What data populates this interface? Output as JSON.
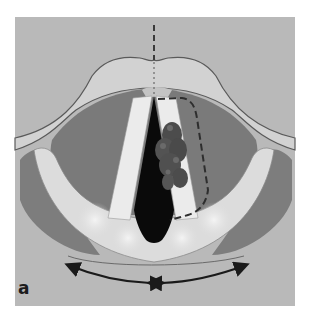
{
  "figure": {
    "panel_label": "a",
    "colors": {
      "background_panel": "#b9b9b9",
      "epiglottis_band": "#d2d2d2",
      "outline": "#5a5a5a",
      "muscle_dark": "#7a7a7a",
      "vocal_fold_light": "#e6e6e6",
      "glottis_black": "#0a0a0a",
      "lesion": "#4c4c4c",
      "arrows": "#1a1a1a"
    },
    "annotations": {
      "midline": "dashed vertical midline",
      "resection_line": "dashed line around lesion",
      "arrows": "bidirectional arrows indicating arytenoid movement"
    }
  }
}
